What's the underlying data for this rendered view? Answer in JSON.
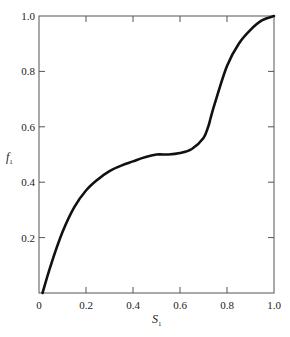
{
  "chart_data": {
    "type": "line",
    "title": "",
    "xlabel": "S",
    "xlabel_sub": "1",
    "ylabel": "f",
    "ylabel_sub": "1",
    "xlim": [
      0,
      1.0
    ],
    "ylim": [
      0,
      1.0
    ],
    "grid": false,
    "legend": null,
    "x_ticks": [
      "0",
      "0.2",
      "0.4",
      "0.6",
      "0.8",
      "1.0"
    ],
    "y_ticks": [
      "0.2",
      "0.4",
      "0.6",
      "0.8",
      "1.0"
    ],
    "series": [
      {
        "name": "f1 vs S1",
        "x": [
          0.015,
          0.05,
          0.1,
          0.15,
          0.2,
          0.25,
          0.3,
          0.35,
          0.4,
          0.45,
          0.5,
          0.55,
          0.6,
          0.65,
          0.7,
          0.72,
          0.73,
          0.75,
          0.8,
          0.85,
          0.9,
          0.95,
          1.0
        ],
        "y": [
          0.0,
          0.1,
          0.22,
          0.31,
          0.37,
          0.41,
          0.44,
          0.46,
          0.475,
          0.49,
          0.5,
          0.5,
          0.505,
          0.52,
          0.56,
          0.6,
          0.63,
          0.69,
          0.82,
          0.9,
          0.95,
          0.985,
          1.0
        ]
      }
    ]
  }
}
